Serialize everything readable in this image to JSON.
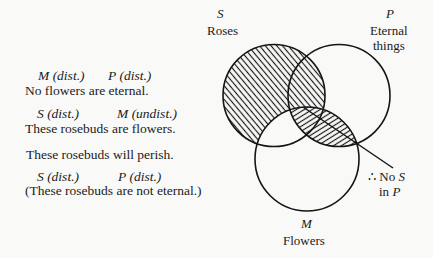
{
  "argument": {
    "premise1": {
      "terms": [
        {
          "letter": "M",
          "distribution": "(dist.)"
        },
        {
          "letter": "P",
          "distribution": "(dist.)"
        }
      ],
      "statement": "No flowers are eternal."
    },
    "premise2": {
      "terms": [
        {
          "letter": "S",
          "distribution": "(dist.)"
        },
        {
          "letter": "M",
          "distribution": "(undist.)"
        }
      ],
      "statement": "These rosebuds are flowers."
    },
    "conclusion": {
      "statement": "These rosebuds will perish.",
      "terms": [
        {
          "letter": "S",
          "distribution": "(dist.)"
        },
        {
          "letter": "P",
          "distribution": "(dist.)"
        }
      ],
      "restatement": "(These rosebuds are not eternal.)"
    }
  },
  "venn": {
    "circles": {
      "S": {
        "letter": "S",
        "name": "Roses"
      },
      "P": {
        "letter": "P",
        "name_line1": "Eternal",
        "name_line2": "things"
      },
      "M": {
        "letter": "M",
        "name": "Flowers"
      }
    },
    "shading": {
      "S_outside_M": "hatched",
      "M_and_P": "hatched"
    },
    "callout": {
      "therefore": "∴",
      "line1_word": "No",
      "line1_term": "S",
      "line2_word": "in",
      "line2_term": "P"
    },
    "colors": {
      "ink": "#151515",
      "background": "#f9f9f8"
    }
  }
}
